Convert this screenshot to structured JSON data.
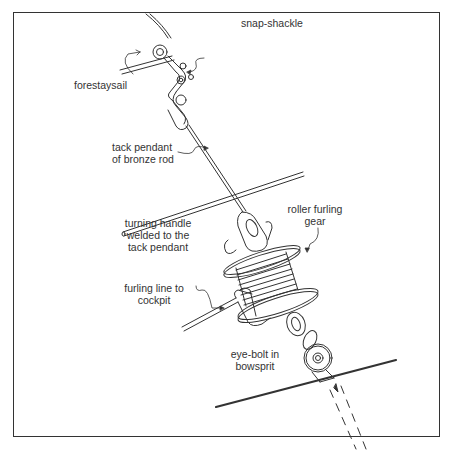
{
  "diagram": {
    "labels": {
      "snap_shackle": "snap-shackle",
      "forestaysail": "forestaysail",
      "tack_pendant_line1": "tack pendant",
      "tack_pendant_line2": "of bronze rod",
      "turning_handle_line1": "turning handle",
      "turning_handle_line2": "welded to the",
      "turning_handle_line3": "tack pendant",
      "roller_furling_line1": "roller furling",
      "roller_furling_line2": "gear",
      "furling_line_line1": "furling line to",
      "furling_line_line2": "cockpit",
      "eye_bolt_line1": "eye-bolt in",
      "eye_bolt_line2": "bowsprit"
    },
    "colors": {
      "ink": "#333333",
      "background": "#ffffff"
    }
  }
}
